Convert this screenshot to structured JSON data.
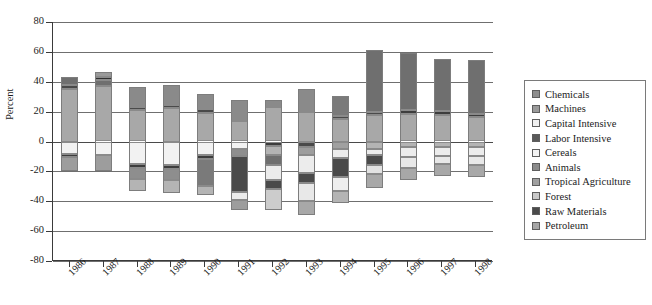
{
  "chart_data": {
    "type": "bar",
    "title": "",
    "subtitle": "",
    "xlabel": "",
    "ylabel": "Percent",
    "ylim": [
      -80,
      80
    ],
    "ytick_labels": [
      "80",
      "60",
      "40",
      "20",
      "0",
      "-20",
      "-40",
      "-60",
      "-80"
    ],
    "ytick_values": [
      80,
      60,
      40,
      20,
      0,
      -20,
      -40,
      -60,
      -80
    ],
    "grid": true,
    "stacked": true,
    "diverging": true,
    "legend_position": "right",
    "categories": [
      "1986",
      "1987",
      "1988",
      "1989",
      "1990",
      "1991",
      "1992",
      "1993",
      "1994",
      "1995",
      "1996",
      "1997",
      "1998"
    ],
    "series": [
      {
        "name": "Chemicals",
        "color": "#6f6f6f",
        "values": [
          5.5,
          7.0,
          13.5,
          13.0,
          10.0,
          14.0,
          -3.0,
          -4.5,
          13.5,
          41.0,
          38.5,
          34.5,
          36.0
        ]
      },
      {
        "name": "Machines",
        "color": "#4a4a4a",
        "values": [
          3.0,
          5.0,
          2.0,
          2.0,
          2.5,
          0.0,
          0.0,
          0.0,
          2.0,
          2.5,
          3.0,
          2.5,
          2.0
        ]
      },
      {
        "name": "Capital Intensive",
        "color": "#ececec",
        "values": [
          0.0,
          1.5,
          0.0,
          0.0,
          0.0,
          0.0,
          -6.0,
          -6.5,
          0.0,
          0.0,
          0.0,
          0.0,
          0.0
        ]
      },
      {
        "name": "Labor Intensive",
        "color": "#4f4f4f",
        "values": [
          0.0,
          3.0,
          0.0,
          0.0,
          0.0,
          0.0,
          -5.5,
          0.0,
          0.0,
          0.0,
          0.0,
          0.0,
          0.0
        ]
      },
      {
        "name": "Cereals",
        "color": "#f2f2f2",
        "values": [
          -8.5,
          -9.0,
          -15.0,
          -15.5,
          -9.0,
          -8.0,
          -10.0,
          -12.0,
          -9.0,
          -6.5,
          -8.5,
          -8.0,
          -8.5
        ]
      },
      {
        "name": "Animals",
        "color": "#8e8e8e",
        "values": [
          -4.0,
          -3.0,
          -4.0,
          -4.5,
          -3.0,
          -3.0,
          -4.0,
          -4.0,
          -4.0,
          -4.5,
          -4.0,
          -3.5,
          -3.5
        ]
      },
      {
        "name": "Tropical Agriculture",
        "color": "#a3a3a3",
        "values": [
          -2.5,
          -2.0,
          -3.5,
          -3.5,
          -2.5,
          -2.5,
          -3.0,
          -3.0,
          -3.0,
          -3.0,
          -2.5,
          -2.5,
          -2.5
        ]
      },
      {
        "name": "Forest",
        "color": "#e2e2e2",
        "values": [
          -3.0,
          -3.5,
          -8.0,
          -8.5,
          -3.0,
          -3.0,
          -5.0,
          -8.0,
          -8.5,
          -7.5,
          -8.0,
          -7.0,
          -7.0
        ]
      },
      {
        "name": "Raw Materials",
        "color": "#3d3d3d",
        "values": [
          -2.0,
          -2.0,
          -3.0,
          -3.0,
          -2.0,
          -17.0,
          -17.0,
          -6.0,
          -12.0,
          -6.5,
          -2.0,
          -2.0,
          -2.0
        ],
        "note": "dark band"
      },
      {
        "name": "Petroleum",
        "color": "#a8a8a8",
        "values": [
          35.0,
          37.0,
          21.0,
          22.5,
          19.0,
          14.0,
          23.0,
          20.0,
          15.0,
          17.5,
          18.5,
          18.0,
          16.5
        ]
      }
    ],
    "bar_totals_positive": [
      43.5,
      46.5,
      35.5,
      37.5,
      31.5,
      28.0,
      23.0,
      20.0,
      30.5,
      61.0,
      60.0,
      55.0,
      54.5
    ],
    "bar_totals_negative": [
      -20.0,
      -19.5,
      -33.5,
      -35.0,
      -19.5,
      -33.5,
      -50.5,
      -39.5,
      -36.5,
      -28.0,
      -25.0,
      -23.0,
      -23.5
    ]
  },
  "legend": {
    "items": [
      {
        "label": "Chemicals",
        "color": "#8e8e8e"
      },
      {
        "label": "Machines",
        "color": "#9a9a9a"
      },
      {
        "label": "Capital Intensive",
        "color": "#f0f0f0"
      },
      {
        "label": "Labor Intensive",
        "color": "#5a5a5a"
      },
      {
        "label": "Cereals",
        "color": "#f4f4f4"
      },
      {
        "label": "Animals",
        "color": "#8b8b8b"
      },
      {
        "label": "Tropical Agriculture",
        "color": "#a0a0a0"
      },
      {
        "label": "Forest",
        "color": "#c9c9c9"
      },
      {
        "label": "Raw Materials",
        "color": "#4a4a4a"
      },
      {
        "label": "Petroleum",
        "color": "#a6a6a6"
      }
    ]
  },
  "bars": [
    {
      "year": "1986",
      "pos": [
        {
          "s": "Petroleum",
          "c": "#a8a8a8",
          "v": 35.0
        },
        {
          "s": "Machines",
          "c": "#4a4a4a",
          "v": 3.0
        },
        {
          "s": "Chemicals",
          "c": "#6f6f6f",
          "v": 5.5
        }
      ],
      "neg": [
        {
          "s": "Cereals",
          "c": "#f2f2f2",
          "v": 8.5
        },
        {
          "s": "Raw Materials",
          "c": "#3d3d3d",
          "v": 2.0
        },
        {
          "s": "Forest",
          "c": "#9d9d9d",
          "v": 9.5
        }
      ]
    },
    {
      "year": "1987",
      "pos": [
        {
          "s": "Petroleum",
          "c": "#a8a8a8",
          "v": 37.0
        },
        {
          "s": "Chemicals",
          "c": "#6f6f6f",
          "v": 4.0
        },
        {
          "s": "Machines",
          "c": "#2f2f2f",
          "v": 2.5
        },
        {
          "s": "Capital Intensive",
          "c": "#9a9a9a",
          "v": 3.0
        }
      ],
      "neg": [
        {
          "s": "Cereals",
          "c": "#f2f2f2",
          "v": 9.0
        },
        {
          "s": "Animals",
          "c": "#9d9d9d",
          "v": 10.5
        }
      ]
    },
    {
      "year": "1988",
      "pos": [
        {
          "s": "Petroleum",
          "c": "#a8a8a8",
          "v": 21.0
        },
        {
          "s": "Machines",
          "c": "#4a4a4a",
          "v": 2.0
        },
        {
          "s": "Chemicals",
          "c": "#8a8a8a",
          "v": 13.5
        }
      ],
      "neg": [
        {
          "s": "Cereals",
          "c": "#f2f2f2",
          "v": 15.0
        },
        {
          "s": "Raw Materials",
          "c": "#3d3d3d",
          "v": 3.0
        },
        {
          "s": "Forest",
          "c": "#8e8e8e",
          "v": 7.0
        },
        {
          "s": "Petroleum",
          "c": "#b4b4b4",
          "v": 8.0
        }
      ]
    },
    {
      "year": "1989",
      "pos": [
        {
          "s": "Petroleum",
          "c": "#a8a8a8",
          "v": 22.5
        },
        {
          "s": "Machines",
          "c": "#4a4a4a",
          "v": 2.0
        },
        {
          "s": "Chemicals",
          "c": "#8a8a8a",
          "v": 13.0
        }
      ],
      "neg": [
        {
          "s": "Cereals",
          "c": "#f2f2f2",
          "v": 15.5
        },
        {
          "s": "Raw Materials",
          "c": "#3d3d3d",
          "v": 3.0
        },
        {
          "s": "Forest",
          "c": "#8e8e8e",
          "v": 7.0
        },
        {
          "s": "Petroleum",
          "c": "#b4b4b4",
          "v": 9.0
        }
      ]
    },
    {
      "year": "1990",
      "pos": [
        {
          "s": "Petroleum",
          "c": "#a8a8a8",
          "v": 19.0
        },
        {
          "s": "Machines",
          "c": "#4a4a4a",
          "v": 2.5
        },
        {
          "s": "Chemicals",
          "c": "#8a8a8a",
          "v": 10.0
        }
      ],
      "neg": [
        {
          "s": "Cereals",
          "c": "#f2f2f2",
          "v": 9.0
        },
        {
          "s": "Raw Materials",
          "c": "#3d3d3d",
          "v": 2.5
        },
        {
          "s": "Forest",
          "c": "#7a7a7a",
          "v": 18.0
        },
        {
          "s": "Petroleum",
          "c": "#b4b4b4",
          "v": 6.0
        }
      ]
    },
    {
      "year": "1991",
      "pos": [
        {
          "s": "Petroleum",
          "c": "#a8a8a8",
          "v": 14.0
        },
        {
          "s": "Chemicals",
          "c": "#8a8a8a",
          "v": 14.0
        }
      ],
      "neg": [
        {
          "s": "Cereals",
          "c": "#f2f2f2",
          "v": 5.0
        },
        {
          "s": "Animals",
          "c": "#8e8e8e",
          "v": 5.0
        },
        {
          "s": "Raw Materials",
          "c": "#4a4a4a",
          "v": 24.0
        },
        {
          "s": "Forest",
          "c": "#ececec",
          "v": 5.0
        },
        {
          "s": "Petroleum",
          "c": "#9d9d9d",
          "v": 7.0
        }
      ]
    },
    {
      "year": "1992",
      "pos": [
        {
          "s": "Petroleum",
          "c": "#a8a8a8",
          "v": 23.0
        },
        {
          "s": "Chemicals",
          "c": "#8a8a8a",
          "v": 5.0
        }
      ],
      "neg": [
        {
          "s": "Machines",
          "c": "#3d3d3d",
          "v": 3.0
        },
        {
          "s": "Cereals",
          "c": "#b4b4b4",
          "v": 6.0
        },
        {
          "s": "Labor Intensive",
          "c": "#6f6f6f",
          "v": 7.0
        },
        {
          "s": "Capital Intensive",
          "c": "#ececec",
          "v": 10.0
        },
        {
          "s": "Raw Materials",
          "c": "#4a4a4a",
          "v": 6.0
        },
        {
          "s": "Forest",
          "c": "#cccccc",
          "v": 14.0
        }
      ]
    },
    {
      "year": "1993",
      "pos": [
        {
          "s": "Petroleum",
          "c": "#a8a8a8",
          "v": 20.0
        },
        {
          "s": "Chemicals",
          "c": "#8a8a8a",
          "v": 15.0
        }
      ],
      "neg": [
        {
          "s": "Machines",
          "c": "#4a4a4a",
          "v": 4.0
        },
        {
          "s": "Cereals",
          "c": "#9d9d9d",
          "v": 5.0
        },
        {
          "s": "Capital Intensive",
          "c": "#ececec",
          "v": 12.0
        },
        {
          "s": "Raw Materials",
          "c": "#4a4a4a",
          "v": 7.0
        },
        {
          "s": "Forest",
          "c": "#e8e8e8",
          "v": 12.0
        },
        {
          "s": "Animals",
          "c": "#a8a8a8",
          "v": 9.0
        }
      ]
    },
    {
      "year": "1994",
      "pos": [
        {
          "s": "Petroleum",
          "c": "#a8a8a8",
          "v": 15.0
        },
        {
          "s": "Machines",
          "c": "#4a4a4a",
          "v": 2.0
        },
        {
          "s": "Chemicals",
          "c": "#7a7a7a",
          "v": 13.5
        }
      ],
      "neg": [
        {
          "s": "Cereals",
          "c": "#a0a0a0",
          "v": 5.0
        },
        {
          "s": "Animals",
          "c": "#ececec",
          "v": 6.0
        },
        {
          "s": "Raw Materials",
          "c": "#4a4a4a",
          "v": 13.0
        },
        {
          "s": "Forest",
          "c": "#eeeeee",
          "v": 9.0
        },
        {
          "s": "Petroleum",
          "c": "#b4b4b4",
          "v": 8.0
        }
      ]
    },
    {
      "year": "1995",
      "pos": [
        {
          "s": "Petroleum",
          "c": "#a8a8a8",
          "v": 17.5
        },
        {
          "s": "Machines",
          "c": "#4a4a4a",
          "v": 2.5
        },
        {
          "s": "Chemicals",
          "c": "#6f6f6f",
          "v": 41.0
        }
      ],
      "neg": [
        {
          "s": "Cereals",
          "c": "#b4b4b4",
          "v": 5.0
        },
        {
          "s": "Animals",
          "c": "#ececec",
          "v": 4.0
        },
        {
          "s": "Raw Materials",
          "c": "#4a4a4a",
          "v": 7.0
        },
        {
          "s": "Forest",
          "c": "#e2e2e2",
          "v": 6.0
        },
        {
          "s": "Petroleum",
          "c": "#a8a8a8",
          "v": 9.0
        }
      ]
    },
    {
      "year": "1996",
      "pos": [
        {
          "s": "Petroleum",
          "c": "#a8a8a8",
          "v": 18.5
        },
        {
          "s": "Machines",
          "c": "#3d3d3d",
          "v": 2.5
        },
        {
          "s": "Chemicals",
          "c": "#6f6f6f",
          "v": 38.5
        }
      ],
      "neg": [
        {
          "s": "Cereals",
          "c": "#b4b4b4",
          "v": 4.0
        },
        {
          "s": "Animals",
          "c": "#ececec",
          "v": 6.5
        },
        {
          "s": "Forest",
          "c": "#e8e8e8",
          "v": 7.0
        },
        {
          "s": "Petroleum",
          "c": "#a8a8a8",
          "v": 8.0
        }
      ]
    },
    {
      "year": "1997",
      "pos": [
        {
          "s": "Petroleum",
          "c": "#a8a8a8",
          "v": 18.0
        },
        {
          "s": "Machines",
          "c": "#3d3d3d",
          "v": 2.5
        },
        {
          "s": "Chemicals",
          "c": "#6f6f6f",
          "v": 34.5
        }
      ],
      "neg": [
        {
          "s": "Cereals",
          "c": "#b4b4b4",
          "v": 4.0
        },
        {
          "s": "Animals",
          "c": "#ececec",
          "v": 6.0
        },
        {
          "s": "Forest",
          "c": "#e8e8e8",
          "v": 5.0
        },
        {
          "s": "Petroleum",
          "c": "#a8a8a8",
          "v": 8.0
        }
      ]
    },
    {
      "year": "1998",
      "pos": [
        {
          "s": "Petroleum",
          "c": "#a8a8a8",
          "v": 16.5
        },
        {
          "s": "Machines",
          "c": "#3d3d3d",
          "v": 2.0
        },
        {
          "s": "Chemicals",
          "c": "#6f6f6f",
          "v": 36.0
        }
      ],
      "neg": [
        {
          "s": "Cereals",
          "c": "#b4b4b4",
          "v": 4.0
        },
        {
          "s": "Animals",
          "c": "#ececec",
          "v": 6.0
        },
        {
          "s": "Forest",
          "c": "#e8e8e8",
          "v": 5.5
        },
        {
          "s": "Petroleum",
          "c": "#a8a8a8",
          "v": 8.0
        }
      ]
    }
  ]
}
